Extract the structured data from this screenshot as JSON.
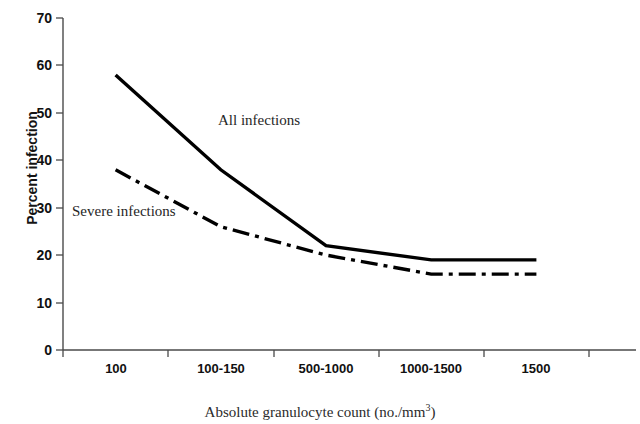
{
  "chart_data": {
    "type": "line",
    "title": "",
    "subtitle": "",
    "xlabel_text": "Absolute granulocyte count (no./mm",
    "xlabel_sup": "3",
    "xlabel_tail": ")",
    "xlabel_full": "Absolute granulocyte count (no./mm3)",
    "ylabel": "Percent infection",
    "categories": [
      "100",
      "100-150",
      "500-1000",
      "1000-1500",
      "1500"
    ],
    "ylim": [
      0,
      70
    ],
    "ytick_values": [
      "70",
      "60",
      "50",
      "40",
      "30",
      "20",
      "10",
      "0"
    ],
    "ytick_step": 10,
    "grid": false,
    "legend_position": "inline-annotations",
    "series": [
      {
        "name": "All infections",
        "label": "All infections",
        "style": "solid",
        "color": "#000000",
        "width": 3.4,
        "values": [
          58,
          38,
          22,
          19,
          19
        ]
      },
      {
        "name": "Severe infections",
        "label": "Severe infections",
        "style": "dash-dot",
        "color": "#000000",
        "width": 3.4,
        "values": [
          38,
          26,
          20,
          16,
          16
        ]
      }
    ],
    "annotations": [
      {
        "text": "All infections",
        "x_px": 218,
        "y_px": 112
      },
      {
        "text": "Severe infections",
        "x_px": 72,
        "y_px": 203
      }
    ]
  },
  "axis": {
    "color": "#4a4a4a",
    "tick_color": "#4a4a4a"
  }
}
